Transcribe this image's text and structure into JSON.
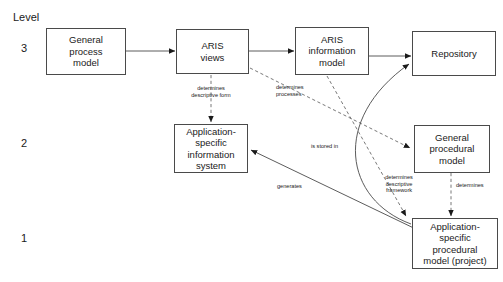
{
  "diagram": {
    "axis": {
      "title": "Level",
      "levels": [
        {
          "value": "3"
        },
        {
          "value": "2"
        },
        {
          "value": "1"
        }
      ]
    },
    "nodes": [
      {
        "id": "general-process-model",
        "label": "General\nprocess\nmodel"
      },
      {
        "id": "aris-views",
        "label": "ARIS\nviews"
      },
      {
        "id": "aris-information-model",
        "label": "ARIS\ninformation\nmodel"
      },
      {
        "id": "repository",
        "label": "Repository"
      },
      {
        "id": "application-specific-information-system",
        "label": "Application-\nspecific\ninformation\nsystem"
      },
      {
        "id": "general-procedural-model",
        "label": "General\nprocedural\nmodel"
      },
      {
        "id": "application-specific-procedural-model",
        "label": "Application-\nspecific\nprocedural\nmodel (project)"
      }
    ],
    "edge_labels": [
      {
        "id": "determines-descriptive-form",
        "text": "determines\ndescriptive form"
      },
      {
        "id": "determines-processes",
        "text": "determines\nprocesses"
      },
      {
        "id": "is-stored-in",
        "text": "is stored in"
      },
      {
        "id": "determines-descriptive-framework",
        "text": "determines\ndescriptive\nframework"
      },
      {
        "id": "generates",
        "text": "generates"
      },
      {
        "id": "determines",
        "text": "determines"
      }
    ],
    "colors": {
      "stroke": "#4a4a4a",
      "text": "#1a1a1a",
      "background": "#ffffff"
    }
  }
}
